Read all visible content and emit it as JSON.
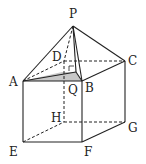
{
  "diagram": {
    "type": "geometry-solid",
    "labels": {
      "P": "P",
      "A": "A",
      "B": "B",
      "C": "C",
      "D": "D",
      "Q": "Q",
      "E": "E",
      "F": "F",
      "G": "G",
      "H": "H"
    },
    "colors": {
      "line": "#222222",
      "shade": "#bdbdbd",
      "background": "#ffffff"
    }
  }
}
